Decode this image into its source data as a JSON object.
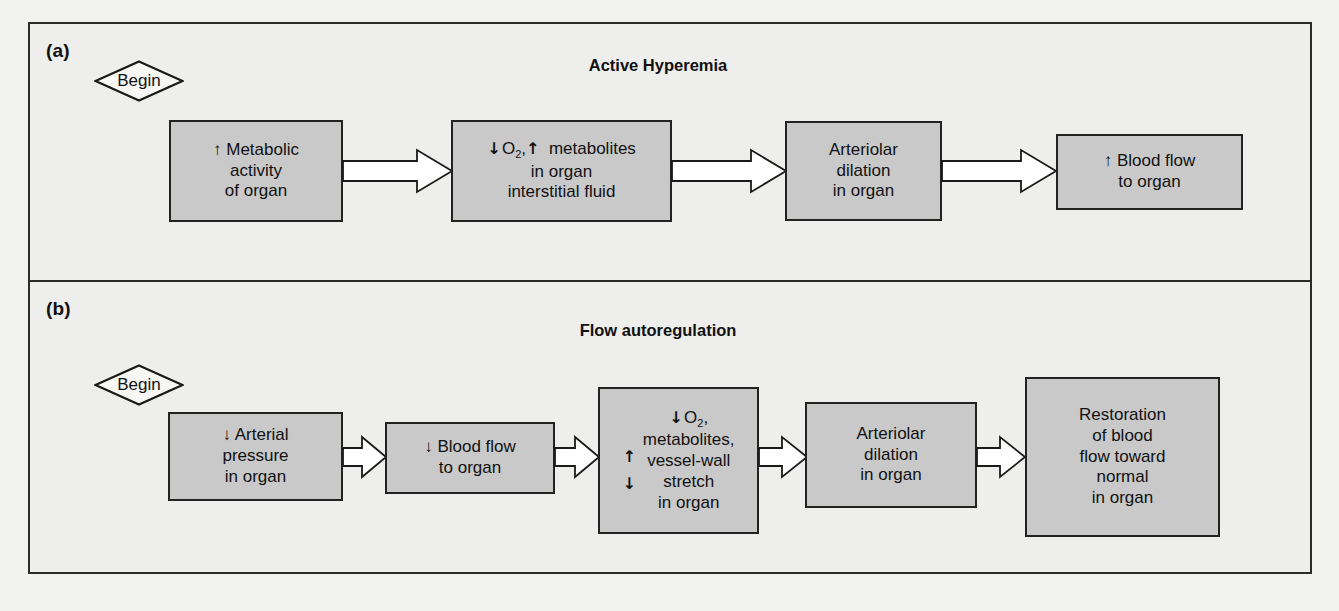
{
  "figure": {
    "background": "#eeeeec",
    "box_fill": "#c9c9c9",
    "stroke": "#222222"
  },
  "panels": [
    {
      "id": "a",
      "label": "(a)",
      "title": "Active Hyperemia",
      "begin_label": "Begin",
      "nodes": [
        {
          "id": "a1",
          "lines": [
            "↑ Metabolic",
            "activity",
            "of organ"
          ]
        },
        {
          "id": "a2",
          "lines": [
            "↓ O2,↑  metabolites",
            "in organ",
            "interstitial fluid"
          ]
        },
        {
          "id": "a3",
          "lines": [
            "Arteriolar",
            "dilation",
            "in organ"
          ]
        },
        {
          "id": "a4",
          "lines": [
            "↑  Blood flow",
            "to organ"
          ]
        }
      ],
      "connections": [
        {
          "from": "a1",
          "to": "a2"
        },
        {
          "from": "a2",
          "to": "a3"
        },
        {
          "from": "a3",
          "to": "a4"
        }
      ]
    },
    {
      "id": "b",
      "label": "(b)",
      "title": "Flow autoregulation",
      "begin_label": "Begin",
      "nodes": [
        {
          "id": "b1",
          "lines": [
            "↓  Arterial",
            "pressure",
            "in organ"
          ]
        },
        {
          "id": "b2",
          "lines": [
            "↓  Blood flow",
            "to organ"
          ]
        },
        {
          "id": "b3",
          "arrows": [
            "↑",
            "↓"
          ],
          "lines": [
            "↓ O2,",
            "metabolites,",
            "vessel-wall",
            "stretch",
            "in organ"
          ]
        },
        {
          "id": "b4",
          "lines": [
            "Arteriolar",
            "dilation",
            "in organ"
          ]
        },
        {
          "id": "b5",
          "lines": [
            "Restoration",
            "of blood",
            "flow toward",
            "normal",
            "in organ"
          ]
        }
      ],
      "connections": [
        {
          "from": "b1",
          "to": "b2"
        },
        {
          "from": "b2",
          "to": "b3"
        },
        {
          "from": "b3",
          "to": "b4"
        },
        {
          "from": "b4",
          "to": "b5"
        }
      ]
    }
  ]
}
